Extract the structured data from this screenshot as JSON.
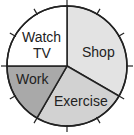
{
  "chart_data": {
    "type": "pie",
    "title": "",
    "start_angle_deg": 0,
    "direction": "clockwise",
    "tick_marks": 12,
    "slices": [
      {
        "label": "Shop",
        "degrees": 120,
        "fraction": 0.3333,
        "color": "#e3e3e3"
      },
      {
        "label": "Exercise",
        "degrees": 90,
        "fraction": 0.25,
        "color": "#d2d2d2"
      },
      {
        "label": "Work",
        "degrees": 60,
        "fraction": 0.1667,
        "color": "#a9a9a9"
      },
      {
        "label": "Watch TV",
        "degrees": 90,
        "fraction": 0.25,
        "color": "#ffffff"
      }
    ]
  },
  "labels": {
    "shop": "Shop",
    "exercise": "Exercise",
    "work": "Work",
    "watch_line1": "Watch",
    "watch_line2": "TV"
  }
}
